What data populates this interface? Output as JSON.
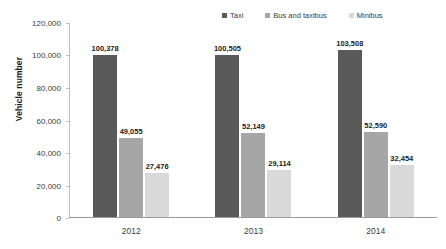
{
  "chart_data": {
    "type": "bar",
    "title": "",
    "subtitle": "",
    "xlabel": "",
    "ylabel": "Vehicle number",
    "categories": [
      "2012",
      "2013",
      "2014"
    ],
    "ylim": [
      0,
      120000
    ],
    "ytick_labels": [
      "120,000",
      "100,000",
      "80,000",
      "60,000",
      "40,000",
      "20,000",
      "0"
    ],
    "ytick_values": [
      120000,
      100000,
      80000,
      60000,
      40000,
      20000,
      0
    ],
    "grid": false,
    "legend_position": "top-right",
    "series": [
      {
        "name": "Taxi",
        "color": "#595959",
        "values": [
          100378,
          100505,
          103508
        ],
        "labels": [
          "100,378",
          "100,505",
          "103,508"
        ]
      },
      {
        "name": "Bus and taxibus",
        "color": "#a6a6a6",
        "values": [
          49055,
          52149,
          52590
        ],
        "labels": [
          "49,055",
          "52,149",
          "52,590"
        ]
      },
      {
        "name": "Minibus",
        "color": "#d9d9d9",
        "values": [
          27476,
          29114,
          32454
        ],
        "labels": [
          "27,476",
          "29,114",
          "32,454"
        ]
      }
    ]
  }
}
